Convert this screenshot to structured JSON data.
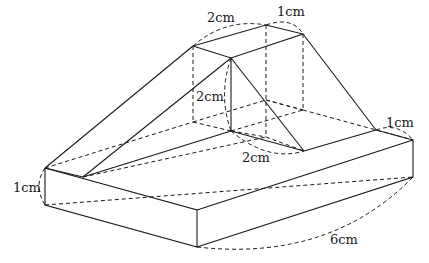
{
  "diagram": {
    "type": "3d-solid-isometric",
    "labels": {
      "top_width": "2cm",
      "top_depth": "1cm",
      "column_height": "2cm",
      "inner_depth": "2cm",
      "right_depth": "1cm",
      "base_height": "1cm",
      "base_length": "6cm"
    },
    "colors": {
      "line": "#1a1a1a",
      "background": "#ffffff"
    }
  }
}
